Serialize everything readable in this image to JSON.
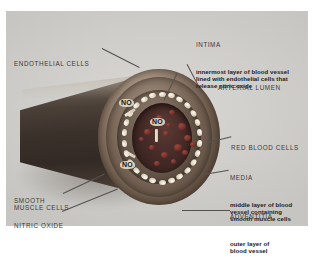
{
  "figure": {
    "background_color": "#ffffff",
    "panel_color": "#d2d1cd"
  },
  "labels": {
    "endothelial_cells": {
      "head": "ENDOTHELIAL CELLS",
      "desc": ""
    },
    "intima": {
      "head": "INTIMA",
      "desc": "innermost layer of blood vessel\nlined with endothelial cells that\nrelease nitric oxide"
    },
    "arterial_lumen": {
      "head": "ARTERIAL LUMEN",
      "desc": ""
    },
    "red_blood_cells": {
      "head": "RED BLOOD CELLS",
      "desc": ""
    },
    "media": {
      "head": "MEDIA",
      "desc": "middle layer of blood\nvessel containing\nsmooth muscle cells"
    },
    "adventitia": {
      "head": "ADVENTITIA",
      "desc": "outer layer of\nblood vessel"
    },
    "smooth_muscle_cells": {
      "head": "SMOOTH\nMUSCLE CELLS",
      "desc": ""
    },
    "nitric_oxide": {
      "head": "NITRIC OXIDE",
      "desc": ""
    }
  },
  "annotations": {
    "no_badges": [
      "NO",
      "NO",
      "NO"
    ]
  },
  "colors": {
    "adventitia": "#6a5748",
    "media": "#7d6a5b",
    "intima": "#6a5a4d",
    "lumen": "#462b27",
    "endothelial_cell": "#fdfbf3",
    "red_blood_cell": "#6e2d27",
    "leader_line": "#55524d",
    "text": "#20201f"
  }
}
